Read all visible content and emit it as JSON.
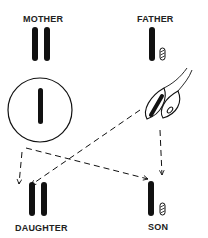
{
  "diagram": {
    "type": "sex-chromosome-inheritance",
    "labels": {
      "mother": "MOTHER",
      "father": "FATHER",
      "daughter": "DAUGHTER",
      "son": "SON"
    },
    "nodes": [
      {
        "id": "mother",
        "label": "MOTHER",
        "chromosomes": [
          "X",
          "X"
        ]
      },
      {
        "id": "father",
        "label": "FATHER",
        "chromosomes": [
          "X",
          "Y"
        ]
      },
      {
        "id": "egg",
        "shape": "circle",
        "chromosomes": [
          "X"
        ]
      },
      {
        "id": "sperm-x",
        "shape": "sperm",
        "chromosomes": [
          "X"
        ]
      },
      {
        "id": "sperm-y",
        "shape": "sperm",
        "chromosomes": [
          "Y"
        ]
      },
      {
        "id": "daughter",
        "label": "DAUGHTER",
        "chromosomes": [
          "X",
          "X"
        ]
      },
      {
        "id": "son",
        "label": "SON",
        "chromosomes": [
          "X",
          "Y"
        ]
      }
    ],
    "edges": [
      {
        "from": "egg",
        "to": "daughter",
        "style": "dashed-arrow"
      },
      {
        "from": "egg",
        "to": "son",
        "style": "dashed-arrow"
      },
      {
        "from": "sperm-x",
        "to": "daughter",
        "style": "dashed-arrow"
      },
      {
        "from": "sperm-y",
        "to": "son",
        "style": "dashed-arrow"
      }
    ],
    "colors": {
      "ink": "#111111",
      "background": "#ffffff"
    }
  }
}
